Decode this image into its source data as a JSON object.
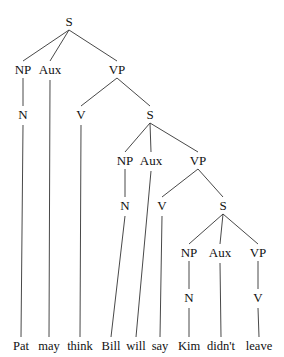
{
  "diagram": {
    "type": "syntax-tree",
    "sentence": "Pat may think Bill will say Kim didn't leave",
    "nodes": [
      {
        "id": "S1",
        "label": "S",
        "x": 69,
        "y": 26
      },
      {
        "id": "NP1",
        "label": "NP",
        "x": 23,
        "y": 74
      },
      {
        "id": "AUX1",
        "label": "Aux",
        "x": 50,
        "y": 74
      },
      {
        "id": "VP1",
        "label": "VP",
        "x": 117,
        "y": 74
      },
      {
        "id": "N1",
        "label": "N",
        "x": 23,
        "y": 119
      },
      {
        "id": "V1",
        "label": "V",
        "x": 81,
        "y": 119
      },
      {
        "id": "S2",
        "label": "S",
        "x": 150,
        "y": 119
      },
      {
        "id": "NP2",
        "label": "NP",
        "x": 125,
        "y": 165
      },
      {
        "id": "AUX2",
        "label": "Aux",
        "x": 151,
        "y": 165
      },
      {
        "id": "VP2",
        "label": "VP",
        "x": 198,
        "y": 165
      },
      {
        "id": "N2",
        "label": "N",
        "x": 125,
        "y": 210
      },
      {
        "id": "V2",
        "label": "V",
        "x": 162,
        "y": 210
      },
      {
        "id": "S3",
        "label": "S",
        "x": 223,
        "y": 210
      },
      {
        "id": "NP3",
        "label": "NP",
        "x": 189,
        "y": 257
      },
      {
        "id": "AUX3",
        "label": "Aux",
        "x": 220,
        "y": 257
      },
      {
        "id": "VP3",
        "label": "VP",
        "x": 258,
        "y": 257
      },
      {
        "id": "N3",
        "label": "N",
        "x": 189,
        "y": 302
      },
      {
        "id": "V3",
        "label": "V",
        "x": 258,
        "y": 302
      }
    ],
    "words": [
      {
        "id": "w1",
        "text": "Pat",
        "x": 21,
        "parent": "N1"
      },
      {
        "id": "w2",
        "text": "may",
        "x": 49,
        "parent": "AUX1"
      },
      {
        "id": "w3",
        "text": "think",
        "x": 80,
        "parent": "V1"
      },
      {
        "id": "w4",
        "text": "Bill",
        "x": 111,
        "parent": "N2"
      },
      {
        "id": "w5",
        "text": "will",
        "x": 136,
        "parent": "AUX2"
      },
      {
        "id": "w6",
        "text": "say",
        "x": 160,
        "parent": "V2"
      },
      {
        "id": "w7",
        "text": "Kim",
        "x": 189,
        "parent": "N3"
      },
      {
        "id": "w8",
        "text": "didn't",
        "x": 221,
        "parent": "AUX3"
      },
      {
        "id": "w9",
        "text": "leave",
        "x": 259,
        "parent": "V3"
      }
    ],
    "word_baseline_y": 350,
    "edges": [
      [
        "S1",
        "NP1"
      ],
      [
        "S1",
        "AUX1"
      ],
      [
        "S1",
        "VP1"
      ],
      [
        "NP1",
        "N1"
      ],
      [
        "VP1",
        "V1"
      ],
      [
        "VP1",
        "S2"
      ],
      [
        "S2",
        "NP2"
      ],
      [
        "S2",
        "AUX2"
      ],
      [
        "S2",
        "VP2"
      ],
      [
        "NP2",
        "N2"
      ],
      [
        "VP2",
        "V2"
      ],
      [
        "VP2",
        "S3"
      ],
      [
        "S3",
        "NP3"
      ],
      [
        "S3",
        "AUX3"
      ],
      [
        "S3",
        "VP3"
      ],
      [
        "NP3",
        "N3"
      ],
      [
        "VP3",
        "V3"
      ]
    ],
    "colors": {
      "line": "#333333",
      "text": "#111111",
      "background": "#ffffff"
    }
  }
}
